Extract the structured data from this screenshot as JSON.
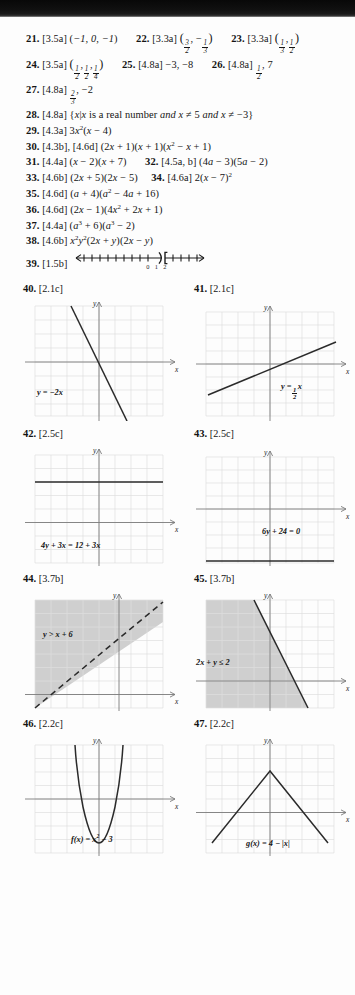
{
  "page": {
    "type": "textbook-answer-key",
    "background_color": "#fdfdfd",
    "ink_color": "#141414",
    "grid_color": "#dadada",
    "axis_color": "#6a6a6a",
    "shade_color": "#c9c9c9"
  },
  "answers": [
    {
      "id": "a21",
      "number": "21.",
      "section": "[3.5a]",
      "answer_html": "(−1, 0, −1)"
    },
    {
      "id": "a22",
      "number": "22.",
      "section": "[3.3a]",
      "answer_html": "(3/2, −1/3)"
    },
    {
      "id": "a23",
      "number": "23.",
      "section": "[3.3a]",
      "answer_html": "(1/3, 1/2)"
    },
    {
      "id": "a24",
      "number": "24.",
      "section": "[3.5a]",
      "answer_html": "(1/2, 1/2, 1/4)"
    },
    {
      "id": "a25",
      "number": "25.",
      "section": "[4.8a]",
      "answer_html": "−3, −8"
    },
    {
      "id": "a26",
      "number": "26.",
      "section": "[4.8a]",
      "answer_html": "1/2, 7"
    },
    {
      "id": "a27",
      "number": "27.",
      "section": "[4.8a]",
      "answer_html": "2/3, −2"
    },
    {
      "id": "a28",
      "number": "28.",
      "section": "[4.8a]",
      "answer_html": "{x | x is a real number and x ≠ 5 and x ≠ −3}"
    },
    {
      "id": "a29",
      "number": "29.",
      "section": "[4.3a]",
      "answer_html": "3x²(x − 4)"
    },
    {
      "id": "a30",
      "number": "30.",
      "section": "[4.3b], [4.6d]",
      "answer_html": "(2x + 1)(x + 1)(x² − x + 1)"
    },
    {
      "id": "a31",
      "number": "31.",
      "section": "[4.4a]",
      "answer_html": "(x − 2)(x + 7)"
    },
    {
      "id": "a32",
      "number": "32.",
      "section": "[4.5a, b]",
      "answer_html": "(4a − 3)(5a − 2)"
    },
    {
      "id": "a33",
      "number": "33.",
      "section": "[4.6b]",
      "answer_html": "(2x + 5)(2x − 5)"
    },
    {
      "id": "a34",
      "number": "34.",
      "section": "[4.6a]",
      "answer_html": "2(x − 7)²"
    },
    {
      "id": "a35",
      "number": "35.",
      "section": "[4.6d]",
      "answer_html": "(a + 4)(a² − 4a + 16)"
    },
    {
      "id": "a36",
      "number": "36.",
      "section": "[4.6d]",
      "answer_html": "(2x − 1)(4x² + 2x + 1)"
    },
    {
      "id": "a37",
      "number": "37.",
      "section": "[4.4a]",
      "answer_html": "(a³ + 6)(a³ − 2)"
    },
    {
      "id": "a38",
      "number": "38.",
      "section": "[4.6b]",
      "answer_html": "x²y²(2x + y)(2x − y)"
    },
    {
      "id": "a39",
      "number": "39.",
      "section": "[1.5b]",
      "answer_html": "number-line-graph"
    }
  ],
  "number_line": {
    "id": "nl39",
    "tick_labels": [
      "0",
      "1",
      "2"
    ],
    "left_endpoint": ")",
    "left_endpoint_value": "1",
    "right_endpoint": "[",
    "right_endpoint_value": "2",
    "left_arrow": true,
    "right_arrow": true
  },
  "graphs": [
    {
      "id": "g40",
      "number": "40.",
      "section": "[2.1c]",
      "label": "y = −2x",
      "kind": "line",
      "slope": -2,
      "intercept": 0,
      "label_pos": {
        "left": 22,
        "top": 92
      }
    },
    {
      "id": "g41",
      "number": "41.",
      "section": "[2.1c]",
      "label": "y = ½x",
      "label_parts": {
        "lead": "y =",
        "num": "1",
        "den": "2",
        "trail": "x"
      },
      "kind": "line",
      "slope": 0.5,
      "intercept": 0,
      "label_pos": {
        "left": 95,
        "top": 88
      }
    },
    {
      "id": "g42",
      "number": "42.",
      "section": "[2.5c]",
      "label": "4y + 3x = 12 + 3x",
      "kind": "horizontal-line",
      "y_value": 3,
      "label_pos": {
        "left": 26,
        "top": 100
      }
    },
    {
      "id": "g43",
      "number": "43.",
      "section": "[2.5c]",
      "label": "6y + 24 = 0",
      "kind": "horizontal-line",
      "y_value": -4,
      "label_pos": {
        "left": 76,
        "top": 88
      }
    },
    {
      "id": "g44",
      "number": "44.",
      "section": "[3.7b]",
      "label": "y > x + 6",
      "kind": "inequality",
      "line_style": "dashed",
      "slope": 1,
      "intercept": 6,
      "shade": "above",
      "label_pos": {
        "left": 28,
        "top": 44
      }
    },
    {
      "id": "g45",
      "number": "45.",
      "section": "[3.7b]",
      "label": "2x + y ≤ 2",
      "kind": "inequality",
      "line_style": "solid",
      "slope": -2,
      "intercept": 2,
      "shade": "below-left",
      "label_pos": {
        "left": 10,
        "top": 72
      }
    },
    {
      "id": "g46",
      "number": "46.",
      "section": "[2.2c]",
      "label": "f(x) = x² − 3",
      "kind": "parabola",
      "vertex": [
        0,
        -3
      ],
      "coefficient": 1,
      "label_pos": {
        "left": 56,
        "top": 104
      }
    },
    {
      "id": "g47",
      "number": "47.",
      "section": "[2.2c]",
      "label": "g(x) = 4 − |x|",
      "kind": "absolute-value",
      "vertex": [
        0,
        4
      ],
      "coefficient": -1,
      "label_pos": {
        "left": 60,
        "top": 108
      }
    }
  ]
}
